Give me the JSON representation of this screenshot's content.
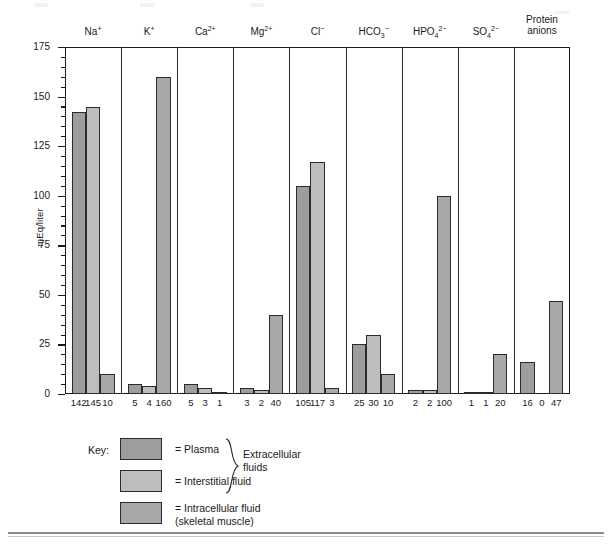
{
  "chart_data": {
    "type": "bar",
    "title": "",
    "xlabel": "",
    "ylabel": "mEq/liter",
    "ylim": [
      0,
      175
    ],
    "ytick_labels": [
      "0",
      "25",
      "50",
      "75",
      "100",
      "125",
      "150",
      "175"
    ],
    "ytick_values": [
      0,
      25,
      50,
      75,
      100,
      125,
      150,
      175
    ],
    "minor_tick_step": 5,
    "grid": false,
    "legend_position": "below-plot",
    "categories": [
      "Na+",
      "K+",
      "Ca2+",
      "Mg2+",
      "Cl-",
      "HCO3-",
      "HPO4 2-",
      "SO4 2-",
      "Protein anions"
    ],
    "category_labels_html": [
      {
        "base": "Na",
        "sup": "+",
        "sub": "",
        "line2": ""
      },
      {
        "base": "K",
        "sup": "+",
        "sub": "",
        "line2": ""
      },
      {
        "base": "Ca",
        "sup": "2+",
        "sub": "",
        "line2": ""
      },
      {
        "base": "Mg",
        "sup": "2+",
        "sub": "",
        "line2": ""
      },
      {
        "base": "Cl",
        "sup": "−",
        "sub": "",
        "line2": ""
      },
      {
        "base": "HCO",
        "sup": "−",
        "sub": "3",
        "line2": ""
      },
      {
        "base": "HPO",
        "sup": "2−",
        "sub": "4",
        "line2": ""
      },
      {
        "base": "SO",
        "sup": "2−",
        "sub": "4",
        "line2": ""
      },
      {
        "base": "Protein",
        "sup": "",
        "sub": "",
        "line2": "anions"
      }
    ],
    "series": [
      {
        "name": "Plasma",
        "color": "#9d9d9d",
        "values": [
          142,
          5,
          5,
          3,
          105,
          25,
          2,
          1,
          16
        ]
      },
      {
        "name": "Interstitial fluid",
        "color": "#bdbdbd",
        "values": [
          145,
          4,
          3,
          2,
          117,
          30,
          2,
          1,
          0
        ]
      },
      {
        "name": "Intracellular fluid (skeletal muscle)",
        "color": "#a8a8a8",
        "values": [
          10,
          160,
          1,
          40,
          3,
          10,
          100,
          20,
          47
        ]
      }
    ],
    "value_labels": [
      [
        "142",
        "145",
        "10"
      ],
      [
        "5",
        "4",
        "160"
      ],
      [
        "5",
        "3",
        "1"
      ],
      [
        "3",
        "2",
        "40"
      ],
      [
        "105",
        "117",
        "3"
      ],
      [
        "25",
        "30",
        "10"
      ],
      [
        "2",
        "2",
        "100"
      ],
      [
        "1",
        "1",
        "20"
      ],
      [
        "16",
        "0",
        "47"
      ]
    ]
  },
  "legend": {
    "key_label": "Key:",
    "items": [
      {
        "swatch": "plasma-swatch",
        "text": "= Plasma"
      },
      {
        "swatch": "interstitial-swatch",
        "text": "= Interstitial fluid"
      },
      {
        "swatch": "intracellular-swatch",
        "text": "= Intracellular fluid"
      }
    ],
    "intracellular_second_line": "(skeletal muscle)",
    "brace_label_line1": "Extracellular",
    "brace_label_line2": "fluids"
  },
  "colors": {
    "plasma": "#9d9d9d",
    "interstitial": "#bdbdbd",
    "intracellular": "#a8a8a8",
    "axis": "#1a1a1a"
  }
}
